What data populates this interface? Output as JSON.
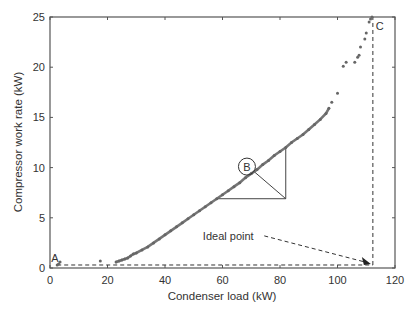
{
  "chart_data": {
    "type": "scatter",
    "title": "",
    "xlabel": "Condenser load (kW)",
    "ylabel": "Compressor work rate (kW)",
    "xlim": [
      0,
      120
    ],
    "ylim": [
      0,
      25
    ],
    "xticks": [
      0,
      20,
      40,
      60,
      80,
      100,
      120
    ],
    "yticks": [
      0,
      5,
      10,
      15,
      20,
      25
    ],
    "xtick_labels": [
      "0",
      "20",
      "40",
      "60",
      "80",
      "100",
      "120"
    ],
    "ytick_labels": [
      "0",
      "5",
      "10",
      "15",
      "20",
      "25"
    ],
    "grid": false,
    "legend": null,
    "series": [
      {
        "name": "Operating points",
        "color": "#666666",
        "points": [
          [
            2.5,
            0.3
          ],
          [
            3.0,
            0.4
          ],
          [
            3.5,
            0.6
          ],
          [
            17.5,
            0.7
          ],
          [
            23,
            0.6
          ],
          [
            24,
            0.7
          ],
          [
            25,
            0.8
          ],
          [
            26,
            0.9
          ],
          [
            27,
            1.0
          ],
          [
            28,
            1.2
          ],
          [
            29,
            1.4
          ],
          [
            30,
            1.5
          ],
          [
            32,
            1.8
          ],
          [
            34,
            2.1
          ],
          [
            36,
            2.5
          ],
          [
            38,
            2.9
          ],
          [
            40,
            3.3
          ],
          [
            42,
            3.7
          ],
          [
            44,
            4.1
          ],
          [
            46,
            4.5
          ],
          [
            48,
            4.9
          ],
          [
            50,
            5.3
          ],
          [
            52,
            5.7
          ],
          [
            54,
            6.1
          ],
          [
            56,
            6.5
          ],
          [
            58,
            6.9
          ],
          [
            60,
            7.3
          ],
          [
            62,
            7.7
          ],
          [
            64,
            8.1
          ],
          [
            66,
            8.5
          ],
          [
            68,
            9.0
          ],
          [
            70,
            9.4
          ],
          [
            72,
            9.8
          ],
          [
            74,
            10.3
          ],
          [
            76,
            10.7
          ],
          [
            78,
            11.2
          ],
          [
            80,
            11.6
          ],
          [
            82,
            12.0
          ],
          [
            84,
            12.5
          ],
          [
            86,
            12.9
          ],
          [
            88,
            13.3
          ],
          [
            90,
            13.8
          ],
          [
            92,
            14.3
          ],
          [
            94,
            14.8
          ],
          [
            96,
            15.4
          ],
          [
            97,
            15.9
          ],
          [
            98,
            16.5
          ],
          [
            100,
            17.4
          ],
          [
            102,
            20.1
          ],
          [
            103,
            20.5
          ],
          [
            106,
            20.5
          ],
          [
            107,
            21.0
          ],
          [
            107.5,
            21.2
          ],
          [
            108,
            22.0
          ],
          [
            109.5,
            22.8
          ],
          [
            110,
            23.4
          ],
          [
            111,
            24.5
          ],
          [
            111.5,
            24.8
          ],
          [
            112,
            25.0
          ]
        ]
      }
    ],
    "annotations": [
      {
        "label": "A",
        "x": 2.5,
        "y": 0.3
      },
      {
        "label": "B",
        "x": 68.5,
        "y": 10.2,
        "shape": "circle"
      },
      {
        "label": "C",
        "x": 112.3,
        "y": 25.0
      },
      {
        "label": "Ideal point",
        "x": 112.3,
        "y": 0.3,
        "text_x": 62,
        "text_y": 3.2,
        "arrow": true
      }
    ],
    "guide_lines": [
      {
        "type": "dashed-horizontal",
        "from": [
          2.5,
          0.3
        ],
        "to": [
          112.3,
          0.3
        ]
      },
      {
        "type": "dashed-vertical",
        "from": [
          112.3,
          0.3
        ],
        "to": [
          112.3,
          25
        ]
      },
      {
        "type": "triangle",
        "vertices": [
          [
            58,
            6.9
          ],
          [
            82,
            6.9
          ],
          [
            82,
            12.0
          ]
        ],
        "hypotenuse_to_B": [
          [
            82,
            6.9
          ],
          [
            71,
            9.6
          ]
        ]
      }
    ]
  },
  "labels": {
    "a": "A",
    "b": "B",
    "c": "C",
    "ideal": "Ideal point"
  }
}
